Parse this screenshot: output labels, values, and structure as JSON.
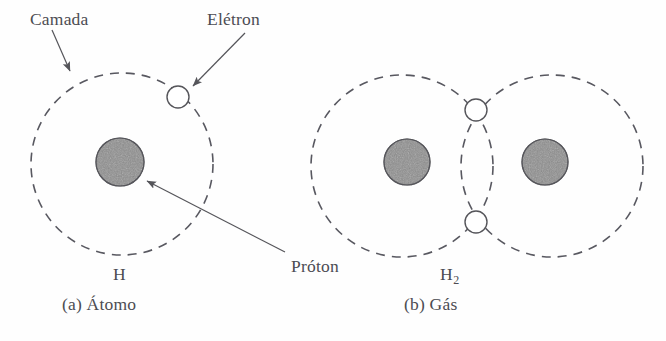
{
  "figure": {
    "labels": {
      "camada": "Camada",
      "eletron": "Elétron",
      "proton": "Próton",
      "h_atom": "H",
      "h_gas_base": "H",
      "h_gas_sub": "2",
      "caption_a": "(a) Átomo",
      "caption_b": "(b) Gás"
    },
    "colors": {
      "ink": "#4c4c52",
      "shell_stroke": "#585860",
      "proton_fill": "#8e8e8e",
      "proton_stroke": "#55555a",
      "electron_fill": "#ffffff",
      "electron_stroke": "#55555a",
      "background": "#fefefe"
    },
    "panels": [
      {
        "id": "atom",
        "caption": "(a) Átomo",
        "formula": "H",
        "shells": [
          {
            "cx": 122,
            "cy": 164,
            "r": 91
          }
        ],
        "protons": [
          {
            "cx": 120,
            "cy": 162,
            "r": 24
          }
        ],
        "electrons": [
          {
            "cx": 178,
            "cy": 97,
            "r": 11
          }
        ]
      },
      {
        "id": "gas",
        "caption": "(b) Gás",
        "formula": "H2",
        "shells": [
          {
            "cx": 402,
            "cy": 166,
            "r": 91
          },
          {
            "cx": 552,
            "cy": 166,
            "r": 91
          }
        ],
        "protons": [
          {
            "cx": 407,
            "cy": 162,
            "r": 23
          },
          {
            "cx": 545,
            "cy": 162,
            "r": 23
          }
        ],
        "electrons": [
          {
            "cx": 476,
            "cy": 110,
            "r": 11
          },
          {
            "cx": 476,
            "cy": 222,
            "r": 11
          }
        ]
      }
    ],
    "annotations": [
      {
        "name": "camada-arrow",
        "x1": 52,
        "y1": 30,
        "x2": 70,
        "y2": 73
      },
      {
        "name": "eletron-arrow",
        "x1": 243,
        "y1": 32,
        "x2": 192,
        "y2": 85
      },
      {
        "name": "proton-arrow",
        "x1": 283,
        "y1": 253,
        "x2": 145,
        "y2": 180
      }
    ],
    "dash_pattern": "9 7",
    "shell_stroke_width": 1.6
  }
}
